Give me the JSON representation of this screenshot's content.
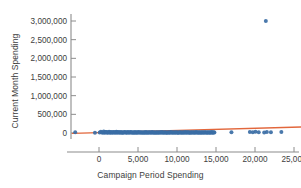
{
  "chart_data": {
    "type": "scatter",
    "title": "",
    "xlabel": "Campaign Period Spending",
    "ylabel": "Current Month Spending",
    "xlim": [
      -3800,
      28600
    ],
    "ylim": [
      -190000,
      3180000
    ],
    "xticks": [
      0,
      5000,
      10000,
      15000,
      20000,
      25000
    ],
    "xticklabels": [
      "0",
      "5,000",
      "10,000",
      "15,000",
      "20,000",
      "25,000"
    ],
    "yticks": [
      0,
      500000,
      1000000,
      1500000,
      2000000,
      2500000,
      3000000
    ],
    "yticklabels": [
      "0",
      "500,000",
      "1,000,000",
      "1,500,000",
      "2,000,000",
      "2,500,000",
      "3,000,000"
    ],
    "grid": false,
    "legend": null,
    "marker_color": "#3b6ea5",
    "trendline_color": "#e2673c",
    "axis_color": "#8c8c8c",
    "text_color": "#3d3d3d",
    "series": [
      {
        "name": "Advertisers",
        "marker": "circle",
        "points": [
          [
            -3050,
            22000
          ],
          [
            -520,
            10000
          ],
          [
            80,
            16000
          ],
          [
            240,
            34000
          ],
          [
            360,
            12000
          ],
          [
            520,
            8000
          ],
          [
            610,
            41000
          ],
          [
            700,
            18000
          ],
          [
            780,
            6000
          ],
          [
            860,
            25000
          ],
          [
            940,
            30000
          ],
          [
            1020,
            14000
          ],
          [
            1120,
            9000
          ],
          [
            1200,
            21000
          ],
          [
            1290,
            36000
          ],
          [
            1380,
            11000
          ],
          [
            1460,
            7000
          ],
          [
            1540,
            26000
          ],
          [
            1630,
            15000
          ],
          [
            1710,
            19000
          ],
          [
            1790,
            5000
          ],
          [
            1880,
            28000
          ],
          [
            1960,
            13000
          ],
          [
            2050,
            23000
          ],
          [
            2130,
            9000
          ],
          [
            2220,
            31000
          ],
          [
            2300,
            17000
          ],
          [
            2380,
            6000
          ],
          [
            2470,
            24000
          ],
          [
            2560,
            12000
          ],
          [
            2640,
            20000
          ],
          [
            2720,
            8000
          ],
          [
            2810,
            27000
          ],
          [
            2900,
            15000
          ],
          [
            2980,
            10000
          ],
          [
            3060,
            22000
          ],
          [
            3150,
            7000
          ],
          [
            3240,
            18000
          ],
          [
            3320,
            29000
          ],
          [
            3400,
            11000
          ],
          [
            3490,
            16000
          ],
          [
            3580,
            6000
          ],
          [
            3660,
            25000
          ],
          [
            3740,
            13000
          ],
          [
            3830,
            20000
          ],
          [
            3920,
            9000
          ],
          [
            4000,
            17000
          ],
          [
            4080,
            28000
          ],
          [
            4170,
            12000
          ],
          [
            4260,
            7000
          ],
          [
            4340,
            21000
          ],
          [
            4420,
            15000
          ],
          [
            4510,
            10000
          ],
          [
            4600,
            24000
          ],
          [
            4680,
            8000
          ],
          [
            4760,
            19000
          ],
          [
            4850,
            14000
          ],
          [
            4940,
            6000
          ],
          [
            5020,
            26000
          ],
          [
            5100,
            11000
          ],
          [
            5190,
            18000
          ],
          [
            5280,
            9000
          ],
          [
            5360,
            23000
          ],
          [
            5440,
            13000
          ],
          [
            5530,
            16000
          ],
          [
            5620,
            7000
          ],
          [
            5700,
            21000
          ],
          [
            5780,
            12000
          ],
          [
            5870,
            10000
          ],
          [
            5960,
            25000
          ],
          [
            6040,
            8000
          ],
          [
            6120,
            17000
          ],
          [
            6210,
            14000
          ],
          [
            6300,
            6000
          ],
          [
            6380,
            22000
          ],
          [
            6460,
            11000
          ],
          [
            6550,
            19000
          ],
          [
            6640,
            9000
          ],
          [
            6720,
            15000
          ],
          [
            6800,
            24000
          ],
          [
            6890,
            12000
          ],
          [
            6980,
            7000
          ],
          [
            7060,
            20000
          ],
          [
            7140,
            16000
          ],
          [
            7230,
            10000
          ],
          [
            7320,
            23000
          ],
          [
            7400,
            8000
          ],
          [
            7480,
            18000
          ],
          [
            7570,
            13000
          ],
          [
            7660,
            6000
          ],
          [
            7740,
            21000
          ],
          [
            7820,
            11000
          ],
          [
            7910,
            17000
          ],
          [
            8000,
            9000
          ],
          [
            8080,
            25000
          ],
          [
            8160,
            14000
          ],
          [
            8250,
            12000
          ],
          [
            8340,
            7000
          ],
          [
            8420,
            19000
          ],
          [
            8500,
            22000
          ],
          [
            8590,
            10000
          ],
          [
            8680,
            15000
          ],
          [
            8760,
            8000
          ],
          [
            8840,
            20000
          ],
          [
            8930,
            13000
          ],
          [
            9020,
            16000
          ],
          [
            9100,
            6000
          ],
          [
            9180,
            24000
          ],
          [
            9270,
            11000
          ],
          [
            9360,
            18000
          ],
          [
            9440,
            9000
          ],
          [
            9520,
            14000
          ],
          [
            9610,
            21000
          ],
          [
            9700,
            12000
          ],
          [
            9780,
            7000
          ],
          [
            9860,
            17000
          ],
          [
            9950,
            23000
          ],
          [
            10040,
            10000
          ],
          [
            10120,
            15000
          ],
          [
            10200,
            8000
          ],
          [
            10290,
            19000
          ],
          [
            10380,
            13000
          ],
          [
            10460,
            22000
          ],
          [
            10540,
            6000
          ],
          [
            10630,
            16000
          ],
          [
            10720,
            11000
          ],
          [
            10800,
            18000
          ],
          [
            10880,
            9000
          ],
          [
            10970,
            14000
          ],
          [
            11060,
            25000
          ],
          [
            11140,
            12000
          ],
          [
            11220,
            7000
          ],
          [
            11310,
            20000
          ],
          [
            11400,
            17000
          ],
          [
            11480,
            10000
          ],
          [
            11560,
            23000
          ],
          [
            11650,
            8000
          ],
          [
            11740,
            15000
          ],
          [
            11820,
            13000
          ],
          [
            11900,
            21000
          ],
          [
            11990,
            6000
          ],
          [
            12080,
            18000
          ],
          [
            12160,
            11000
          ],
          [
            12240,
            16000
          ],
          [
            12330,
            9000
          ],
          [
            12420,
            24000
          ],
          [
            12500,
            12000
          ],
          [
            12580,
            19000
          ],
          [
            12670,
            7000
          ],
          [
            12760,
            14000
          ],
          [
            12840,
            22000
          ],
          [
            12920,
            10000
          ],
          [
            13010,
            17000
          ],
          [
            13100,
            8000
          ],
          [
            13180,
            15000
          ],
          [
            13260,
            20000
          ],
          [
            13350,
            13000
          ],
          [
            13440,
            6000
          ],
          [
            13520,
            18000
          ],
          [
            13600,
            11000
          ],
          [
            13690,
            23000
          ],
          [
            13780,
            9000
          ],
          [
            13860,
            16000
          ],
          [
            13940,
            14000
          ],
          [
            14030,
            21000
          ],
          [
            14120,
            7000
          ],
          [
            14200,
            12000
          ],
          [
            14280,
            19000
          ],
          [
            14370,
            10000
          ],
          [
            14460,
            25000
          ],
          [
            14540,
            15000
          ],
          [
            14620,
            8000
          ],
          [
            14710,
            17000
          ],
          [
            14800,
            13000
          ],
          [
            16980,
            20000
          ],
          [
            19340,
            26000
          ],
          [
            19720,
            18000
          ],
          [
            20060,
            31000
          ],
          [
            20480,
            22000
          ],
          [
            21180,
            15000
          ],
          [
            21390,
            3000000
          ],
          [
            21520,
            28000
          ],
          [
            22040,
            19000
          ],
          [
            23380,
            24000
          ],
          [
            27420,
            21000
          ]
        ]
      }
    ],
    "trendline": {
      "name": "linear-fit",
      "x": [
        -3400,
        28400
      ],
      "y": [
        -10000,
        175000
      ]
    }
  }
}
